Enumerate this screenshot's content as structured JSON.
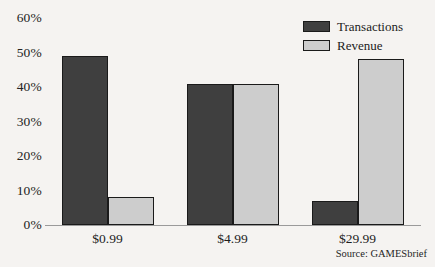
{
  "chart_data": {
    "type": "bar",
    "title": "",
    "subtitle": "",
    "xlabel": "",
    "ylabel": "",
    "categories": [
      "$0.99",
      "$4.99",
      "$29.99"
    ],
    "series": [
      {
        "name": "Transactions",
        "color": "#3f3f3f",
        "values": [
          49,
          41,
          7
        ]
      },
      {
        "name": "Revenue",
        "color": "#cdcdcd",
        "values": [
          8,
          41,
          48
        ]
      }
    ],
    "ylim": [
      0,
      60
    ],
    "ytick_values": [
      0,
      10,
      20,
      30,
      40,
      50,
      60
    ],
    "ytick_labels": [
      "0%",
      "10%",
      "20%",
      "30%",
      "40%",
      "50%",
      "60%"
    ],
    "grid": false,
    "legend_position": "top-right",
    "annotations": [
      "Source: GAMESbrief"
    ]
  },
  "legend": {
    "items": [
      {
        "label": "Transactions"
      },
      {
        "label": "Revenue"
      }
    ]
  },
  "source": {
    "text": "Source: GAMESbrief"
  },
  "colors": {
    "background": "#f5f3f1",
    "transactions": "#3f3f3f",
    "revenue": "#cdcdcd",
    "axis": "#9a9a9a",
    "outline": "#1a1a1a"
  }
}
